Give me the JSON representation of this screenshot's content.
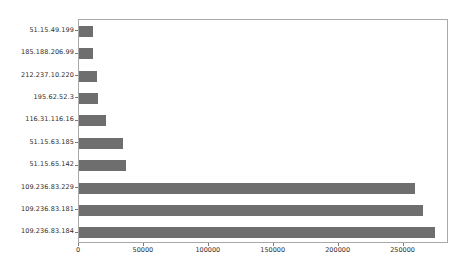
{
  "chart_data": {
    "type": "bar",
    "orientation": "horizontal",
    "title": "",
    "xlabel": "",
    "ylabel": "",
    "grid": false,
    "legend": null,
    "xlim": [
      0,
      285000
    ],
    "xticks": [
      0,
      50000,
      100000,
      150000,
      200000,
      250000
    ],
    "xticklabels": [
      "0",
      "50000",
      "100000",
      "150000",
      "200000",
      "250000"
    ],
    "categories": [
      "51.15.49.199",
      "185.188.206.99",
      "212.237.10.220",
      "195.62.52.3",
      "116.31.116.16",
      "51.15.63.185",
      "51.15.65.142",
      "109.236.83.229",
      "109.236.83.181",
      "109.236.83.184"
    ],
    "values": [
      11000,
      11000,
      14000,
      14500,
      21000,
      34000,
      36000,
      259000,
      265000,
      274000
    ],
    "bar_color": "#6e6e6e"
  },
  "figure": {
    "background_color": "#ffffff",
    "axes_edge_color": "#a9a9a9"
  }
}
